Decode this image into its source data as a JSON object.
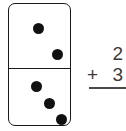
{
  "worksheet": {
    "title": "Domino addition problem",
    "domino": {
      "label": "domino-tile",
      "top_half": {
        "pip_count": 2,
        "pips": [
          {
            "name": "pip-top-1"
          },
          {
            "name": "pip-top-2"
          }
        ]
      },
      "bottom_half": {
        "pip_count": 3,
        "pips": [
          {
            "name": "pip-bottom-1"
          },
          {
            "name": "pip-bottom-2"
          },
          {
            "name": "pip-bottom-3"
          }
        ]
      },
      "outline_color": "#1a1a1a",
      "pip_color": "#111111",
      "face_color": "#ffffff"
    },
    "equation": {
      "addend_top": "2",
      "operator": "+",
      "addend_bottom": "3",
      "sum": "",
      "text_color": "#3a3a3a",
      "rule_color": "#4a4a4a"
    }
  }
}
